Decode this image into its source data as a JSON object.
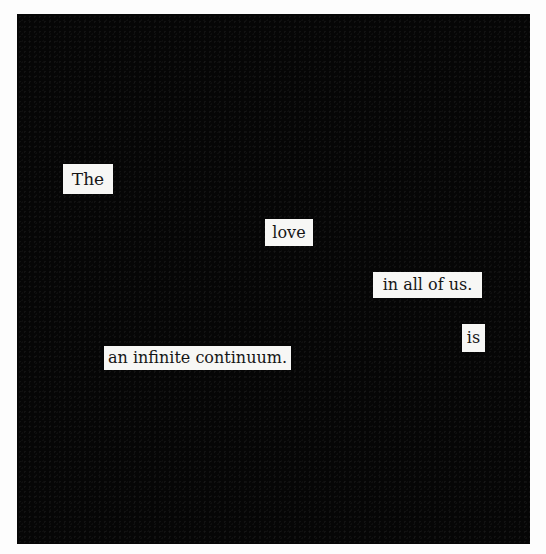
{
  "poem": {
    "words": [
      {
        "text": "The",
        "x": 63,
        "y": 164,
        "w": 50,
        "h": 30
      },
      {
        "text": "love",
        "x": 265,
        "y": 219,
        "w": 48,
        "h": 27
      },
      {
        "text": "in all of us.",
        "x": 373,
        "y": 272,
        "w": 109,
        "h": 26
      },
      {
        "text": "is",
        "x": 462,
        "y": 324,
        "w": 23,
        "h": 28
      },
      {
        "text": "an infinite continuum.",
        "x": 104,
        "y": 346,
        "w": 187,
        "h": 24
      }
    ]
  },
  "colors": {
    "background": "#fdfdfd",
    "blackout": "#060606",
    "paper": "#f7f7f5",
    "ink": "#151515"
  }
}
